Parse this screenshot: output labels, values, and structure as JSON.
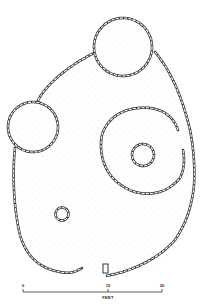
{
  "figure": {
    "type": "archaeological site plan",
    "colors": {
      "ink": "#333333",
      "stipple": "#9a9a9a",
      "background": "#ffffff"
    }
  },
  "scale_bar": {
    "ticks": [
      {
        "label": "0",
        "x": 23
      },
      {
        "label": "15",
        "x": 108
      },
      {
        "label": "30",
        "x": 162
      }
    ],
    "unit": "FEET"
  },
  "features": [
    {
      "name": "outer-enclosure-wall"
    },
    {
      "name": "top-circular-room"
    },
    {
      "name": "left-circular-room"
    },
    {
      "name": "right-ring-wall"
    },
    {
      "name": "central-small-ring"
    },
    {
      "name": "lower-small-ring"
    }
  ]
}
